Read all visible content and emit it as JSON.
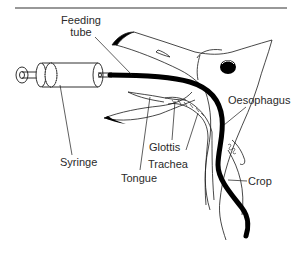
{
  "figure": {
    "type": "anatomical-diagram",
    "labels": {
      "feeding_tube_line1": "Feeding",
      "feeding_tube_line2": "tube",
      "syringe": "Syringe",
      "tongue": "Tongue",
      "glottis": "Glottis",
      "trachea": "Trachea",
      "oesophagus": "Oesophagus",
      "crop": "Crop"
    },
    "colors": {
      "line": "#1a1a1a",
      "tube": "#000000",
      "text": "#2a2a2a",
      "background": "#ffffff"
    }
  }
}
